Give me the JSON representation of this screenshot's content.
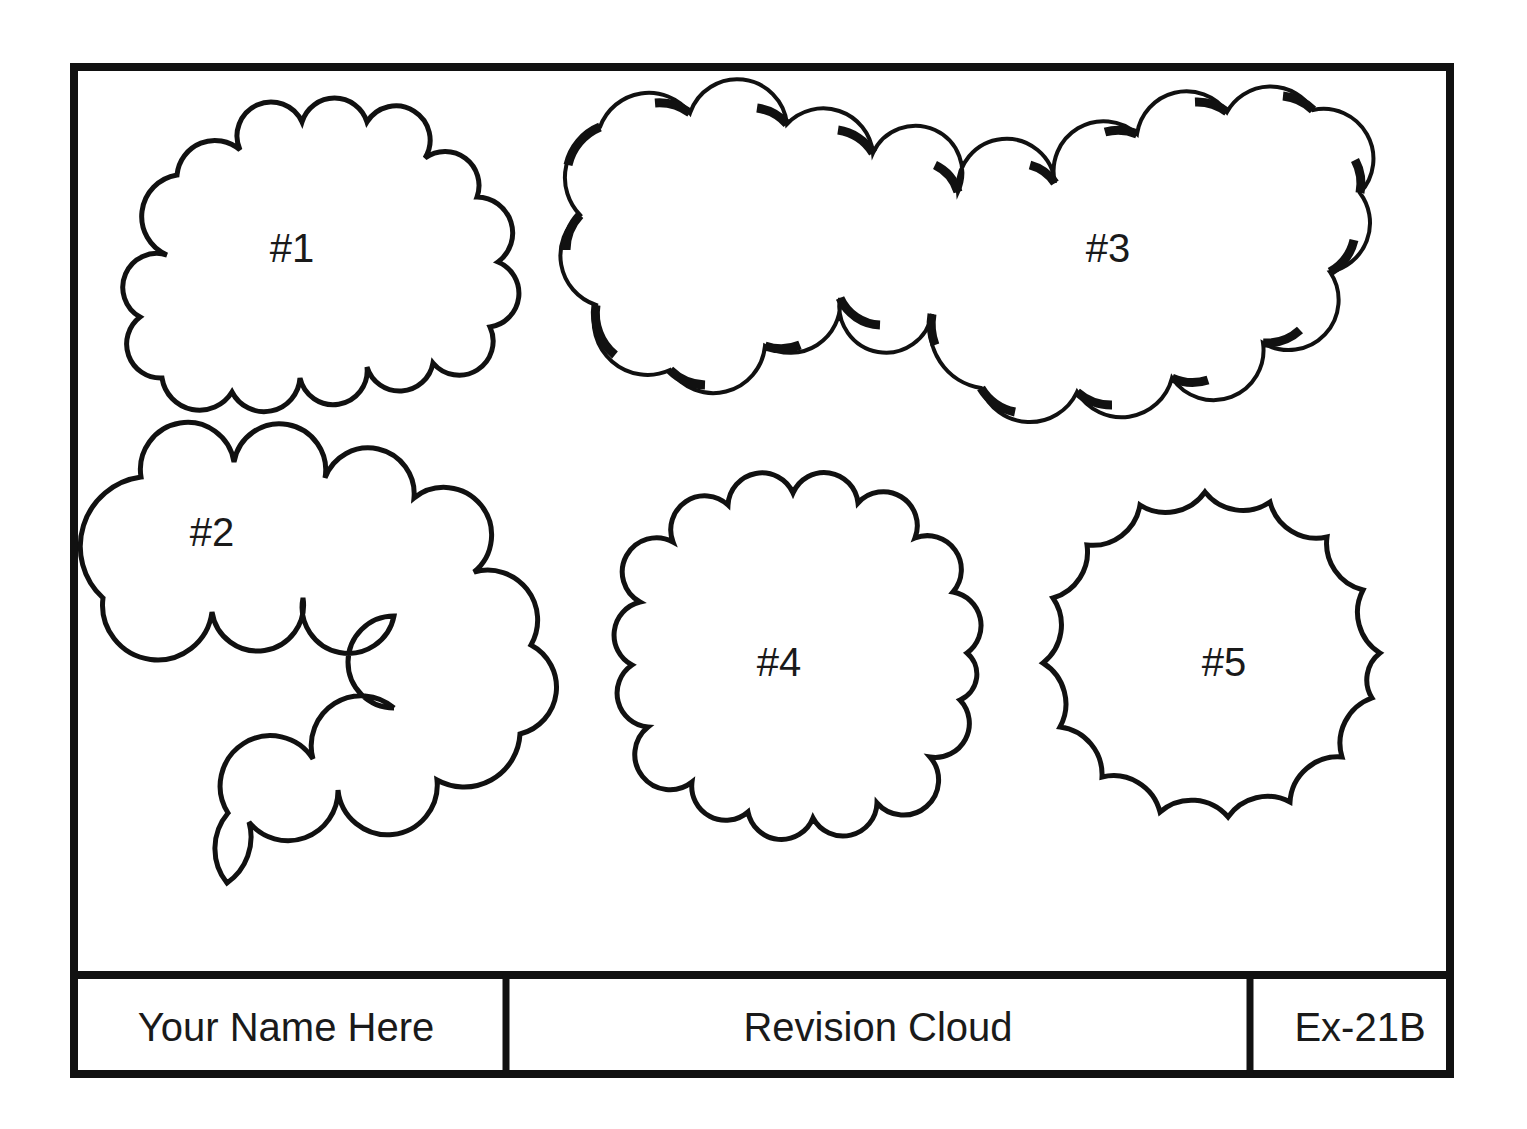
{
  "drawing": {
    "title": "Revision Cloud",
    "author": "Your Name Here",
    "sheet_id": "Ex-21B"
  },
  "clouds": [
    {
      "id": 1,
      "label": "#1",
      "style": "normal"
    },
    {
      "id": 2,
      "label": "#2",
      "style": "normal"
    },
    {
      "id": 3,
      "label": "#3",
      "style": "calligraphy"
    },
    {
      "id": 4,
      "label": "#4",
      "style": "normal"
    },
    {
      "id": 5,
      "label": "#5",
      "style": "reversed"
    }
  ],
  "colors": {
    "line": "#111111",
    "background": "#ffffff"
  }
}
